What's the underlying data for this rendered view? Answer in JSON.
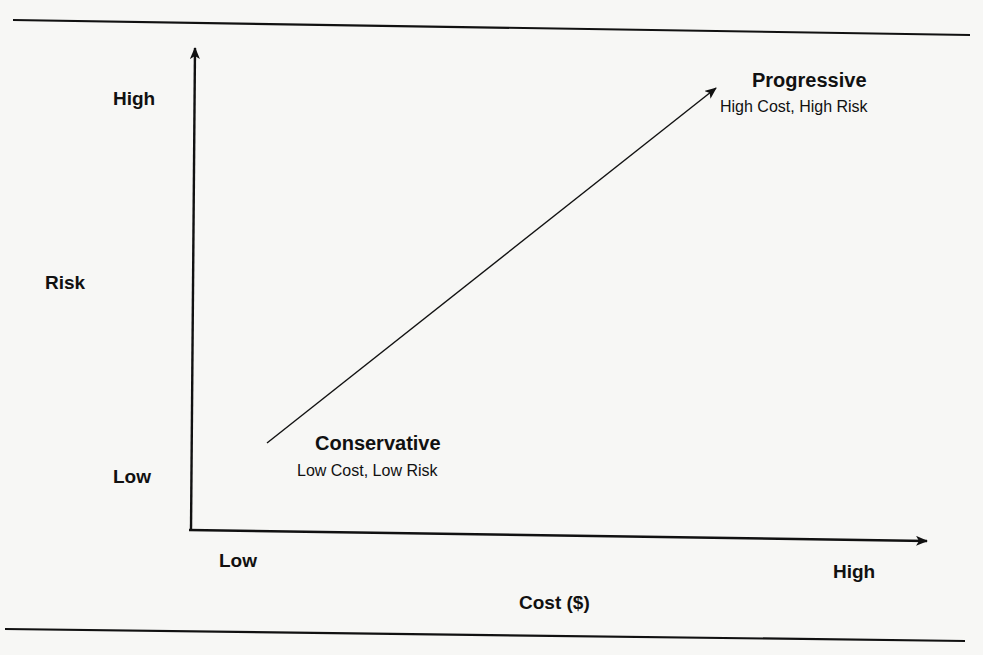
{
  "diagram": {
    "type": "cost-risk quadrant",
    "y_axis": {
      "label": "Risk",
      "high_label": "High",
      "low_label": "Low"
    },
    "x_axis": {
      "label": "Cost ($)",
      "low_label": "Low",
      "high_label": "High"
    },
    "points": [
      {
        "name": "Conservative",
        "description": "Low Cost, Low Risk"
      },
      {
        "name": "Progressive",
        "description": "High Cost, High Risk"
      }
    ],
    "connector": "Arrow from Conservative to Progressive",
    "colors": {
      "background": "#f7f7f5",
      "ink": "#111111"
    }
  }
}
